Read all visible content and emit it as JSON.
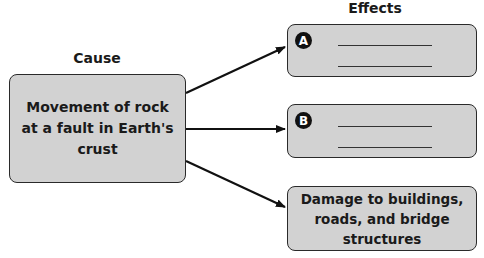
{
  "diagram": {
    "type": "cause-effect",
    "cause": {
      "heading": "Cause",
      "text": "Movement of rock at a fault in Earth's crust"
    },
    "effects": {
      "heading": "Effects",
      "items": [
        {
          "badge": "A",
          "text": "",
          "blank_lines": 2
        },
        {
          "badge": "B",
          "text": "",
          "blank_lines": 2
        },
        {
          "badge": "",
          "text": "Damage to buildings, roads, and bridge structures",
          "blank_lines": 0
        }
      ]
    },
    "colors": {
      "box_fill": "#d2d2d2",
      "box_border": "#2a2a2a",
      "arrow": "#111111",
      "badge_fill": "#111111",
      "badge_text": "#ffffff"
    }
  }
}
